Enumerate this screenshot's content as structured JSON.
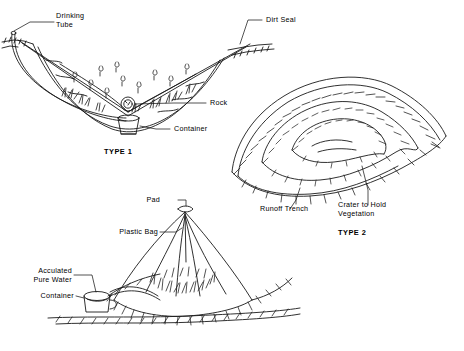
{
  "figure": {
    "kind": "line-drawing"
  },
  "labels": {
    "drinking_tube": "Drinking\nTube",
    "dirt_seal": "Dirt Seal",
    "rock": "Rock",
    "container": "Container",
    "type_1": "TYPE 1",
    "type_2": "TYPE 2",
    "runoff_trench": "Runoff Trench",
    "crater_to_hold_vegetation": "Crater to Hold\nVegetation",
    "pad": "Pad",
    "plastic_bag": "Plastic Bag",
    "accumulated_pure_water": "Acculated\nPure Water",
    "container_2": "Container"
  },
  "colors": {
    "ink": "#1a1a1a",
    "paper": "#ffffff"
  }
}
